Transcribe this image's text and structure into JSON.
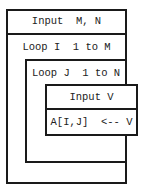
{
  "diagram": {
    "type": "nassi-shneiderman-structogram",
    "blocks": {
      "input_mn": "Input  M, N",
      "loop_i": "Loop I  1 to M",
      "loop_j": "Loop J  1 to N",
      "input_v": "Input V",
      "assign": "A[I,J]  <-- V"
    },
    "colors": {
      "line": "#1a1a1a",
      "text": "#222222",
      "background": "#ffffff"
    }
  }
}
